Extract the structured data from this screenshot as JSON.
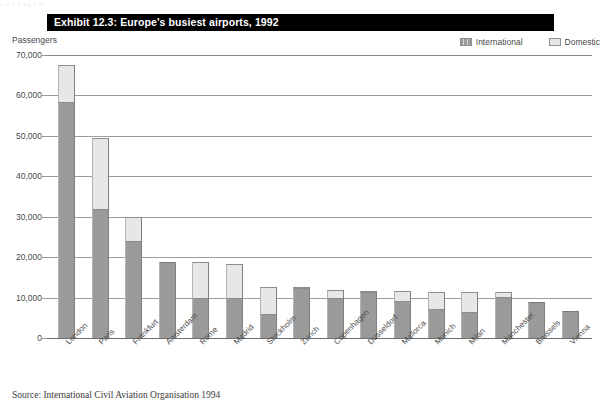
{
  "exhibit": {
    "title": "Exhibit 12.3: Europe's busiest airports, 1992",
    "axis_unit_label": "Passengers",
    "source": "Source: International Civil Aviation Organisation 1994",
    "scan_bleed_text": "a   a        n          p           ng                                                                                                        e        n"
  },
  "legend": {
    "international_label": "International",
    "domestic_label": "Domestic",
    "international_color": "#9a9a9a",
    "domestic_color": "#e7e7e7"
  },
  "chart_data": {
    "type": "bar",
    "title": "Exhibit 12.3: Europe's busiest airports, 1992",
    "subtitle": "",
    "xlabel": "",
    "ylabel": "Passengers",
    "ylim": [
      0,
      70000
    ],
    "yticks": [
      0,
      10000,
      20000,
      30000,
      40000,
      50000,
      60000,
      70000
    ],
    "ytick_labels": [
      "0",
      "10,000",
      "20,000",
      "30,000",
      "40,000",
      "50,000",
      "60,000",
      "70,000"
    ],
    "grid": true,
    "stacked": true,
    "legend_position": "top-right",
    "categories": [
      "London",
      "Paris",
      "Frankfurt",
      "Amsterdam",
      "Rome",
      "Madrid",
      "Stockholm",
      "Zurich",
      "Copenhagen",
      "Dusseldorf",
      "Mallorca",
      "Munich",
      "Milan",
      "Manchester",
      "Brussels",
      "Vienna"
    ],
    "series": [
      {
        "name": "International",
        "color": "#9a9a9a",
        "values": [
          58500,
          32000,
          24000,
          18700,
          10000,
          9800,
          6000,
          12300,
          9900,
          11400,
          9200,
          7200,
          6500,
          10200,
          8800,
          6800
        ]
      },
      {
        "name": "Domestic",
        "color": "#e7e7e7",
        "values": [
          9000,
          17500,
          6000,
          0,
          8700,
          8500,
          6500,
          200,
          2000,
          200,
          2500,
          4300,
          4800,
          1100,
          0,
          0
        ]
      }
    ],
    "totals": [
      67500,
      49500,
      30000,
      18700,
      18700,
      18300,
      12500,
      12500,
      11900,
      11600,
      11700,
      11500,
      11300,
      11300,
      8800,
      6800
    ]
  }
}
